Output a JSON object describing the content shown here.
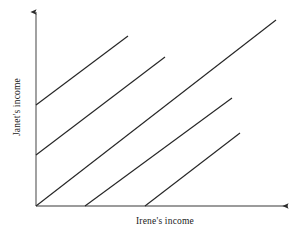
{
  "figure": {
    "background_color": "#ffffff",
    "line_color": "#262626",
    "axis_color": "#7a7a7a",
    "text_color": "#1a1a1a"
  },
  "axes": {
    "x_label": "Irene's income",
    "y_label": "Janet's income",
    "origin": {
      "x": 36,
      "y": 206
    },
    "x_axis_end": {
      "x": 292,
      "y": 206
    },
    "y_axis_end": {
      "x": 36,
      "y": 9
    },
    "x_arrow": "arrow-right",
    "y_arrow": "arrow-up"
  },
  "chart_data": {
    "type": "line",
    "title": "",
    "xlabel": "Irene's income",
    "ylabel": "Janet's income",
    "xlim": [
      0,
      256
    ],
    "ylim": [
      0,
      197
    ],
    "grid": false,
    "legend": null,
    "series": [
      {
        "name": "indifference-curve-1",
        "x": [
          0,
          92
        ],
        "y": [
          101,
          170
        ]
      },
      {
        "name": "indifference-curve-2",
        "x": [
          0,
          129
        ],
        "y": [
          51,
          149
        ]
      },
      {
        "name": "indifference-curve-3",
        "x": [
          0,
          240
        ],
        "y": [
          0,
          186
        ]
      },
      {
        "name": "indifference-curve-4",
        "x": [
          49,
          196
        ],
        "y": [
          0,
          108
        ]
      },
      {
        "name": "indifference-curve-5",
        "x": [
          109,
          204
        ],
        "y": [
          0,
          73
        ]
      }
    ],
    "series_pixel_endpoints": [
      {
        "name": "indifference-curve-1",
        "x1": 36,
        "y1": 105,
        "x2": 128,
        "y2": 36
      },
      {
        "name": "indifference-curve-2",
        "x1": 36,
        "y1": 155,
        "x2": 165,
        "y2": 57
      },
      {
        "name": "indifference-curve-3",
        "x1": 36,
        "y1": 206,
        "x2": 276,
        "y2": 20
      },
      {
        "name": "indifference-curve-4",
        "x1": 85,
        "y1": 206,
        "x2": 232,
        "y2": 98
      },
      {
        "name": "indifference-curve-5",
        "x1": 145,
        "y1": 206,
        "x2": 240,
        "y2": 133
      }
    ]
  }
}
